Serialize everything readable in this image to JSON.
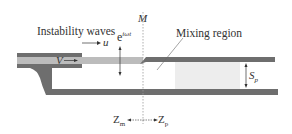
{
  "labels": {
    "instability_waves": "Instability waves",
    "u": "u",
    "e_base": "e",
    "e_exp": "iωt",
    "M": "M",
    "mixing_region": "Mixing region",
    "V": "V",
    "S_base": "S",
    "S_sub": "p",
    "Zm_base": "Z",
    "Zm_sub": "m",
    "Zp_base": "Z",
    "Zp_sub": "p"
  },
  "colors": {
    "wall": "#6e6e6e",
    "flow": "#b9b9b9",
    "mixing": "#ececec",
    "text": "#333333",
    "line": "#888888"
  }
}
